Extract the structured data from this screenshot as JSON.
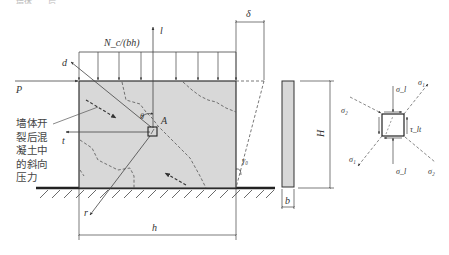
{
  "figure": {
    "top_cutoff_text": "……墙体……后……………",
    "wall_panel": {
      "load_label": "N_c/(bh)",
      "axis_l_label": "l",
      "axis_t_label": "t",
      "axis_d_label": "d",
      "axis_r_label": "r",
      "force_p_label": "P",
      "point_a_label": "A",
      "angle_label": "θ",
      "shear_angle_label": "γ₀",
      "width_label": "h",
      "drift_label": "δ"
    },
    "annotation": {
      "lines": [
        "墙体开",
        "裂后混",
        "凝土中",
        "的斜向",
        "压力"
      ]
    },
    "side_view": {
      "height_label": "H",
      "thickness_label": "b"
    },
    "stress_element": {
      "sigma_l_top": "σ_l",
      "sigma_l_bottom": "σ_l",
      "sigma_1": "σ₁",
      "sigma_2_left": "σ₂",
      "sigma_2_right": "σ₂",
      "sigma_1_lower": "σ₁",
      "tau": "τ_lt"
    },
    "colors": {
      "wall_fill": "#d8d8d8",
      "line": "#444444",
      "dashed": "#555555"
    }
  }
}
